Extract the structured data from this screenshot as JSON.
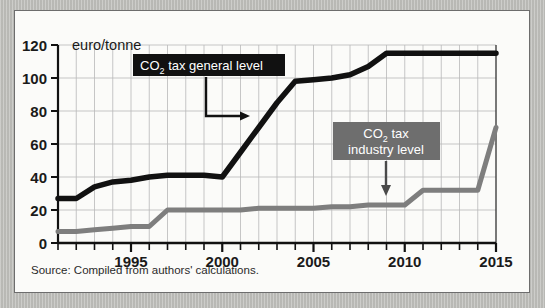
{
  "chart_data": {
    "type": "line",
    "title": "",
    "subtitle": "",
    "xlabel": "",
    "ylabel": "euro/tonne",
    "unit_label": "euro/tonne",
    "xlim": [
      1991,
      2015
    ],
    "ylim": [
      0,
      120
    ],
    "grid": true,
    "legend_position": "inline-annotations",
    "y_ticks": [
      0,
      20,
      40,
      60,
      80,
      100,
      120
    ],
    "y_tick_labels": [
      "0",
      "20",
      "40",
      "60",
      "80",
      "100",
      "120"
    ],
    "x_ticks": [
      1995,
      2000,
      2005,
      2010,
      2015
    ],
    "x_tick_labels": [
      "1995",
      "2000",
      "2005",
      "2010",
      "2015"
    ],
    "x_minor_tick_step": 1,
    "x": [
      1991,
      1992,
      1993,
      1994,
      1995,
      1996,
      1997,
      1998,
      1999,
      2000,
      2001,
      2002,
      2003,
      2004,
      2005,
      2006,
      2007,
      2008,
      2009,
      2010,
      2011,
      2012,
      2013,
      2014,
      2015
    ],
    "series": [
      {
        "name": "CO2 tax general level",
        "color": "#111111",
        "values": [
          27,
          27,
          34,
          37,
          38,
          40,
          41,
          41,
          41,
          40,
          55,
          70,
          85,
          98,
          99,
          100,
          102,
          107,
          115,
          115,
          115,
          115,
          115,
          115,
          115
        ]
      },
      {
        "name": "CO2 tax industry level",
        "color": "#7e7e7e",
        "values": [
          7,
          7,
          8,
          9,
          10,
          10,
          20,
          20,
          20,
          20,
          20,
          21,
          21,
          21,
          21,
          22,
          22,
          23,
          23,
          23,
          32,
          32,
          32,
          32,
          70
        ]
      }
    ],
    "annotations": [
      {
        "name": "general-level-label",
        "text_lines": [
          "CO",
          "2",
          " tax general level"
        ],
        "display_text": "CO2 tax general level",
        "box_color": "#111111",
        "text_color": "#ffffff",
        "arrow": "down-then-right"
      },
      {
        "name": "industry-level-label",
        "text_lines": [
          "CO2 tax",
          "industry level"
        ],
        "line1": "CO",
        "line1_sub": "2",
        "line1_rest": " tax",
        "line2": "industry level",
        "display_text": "CO2 tax industry level",
        "box_color": "#6e6e6e",
        "text_color": "#ffffff",
        "arrow": "down"
      }
    ]
  },
  "figure": {
    "source_note": "Source: Compiled from authors' calculations.",
    "unit_label": "euro/tonne",
    "panel_background": "#fbfbf9",
    "outer_background": "#bcbcb8",
    "grid_color": "#b9b9b9",
    "axis_color": "#111111"
  },
  "labels": {
    "general": {
      "prefix": "CO",
      "subscript": "2",
      "suffix": " tax general level"
    },
    "industry": {
      "line1_prefix": "CO",
      "line1_subscript": "2",
      "line1_suffix": " tax",
      "line2": "industry level"
    }
  }
}
